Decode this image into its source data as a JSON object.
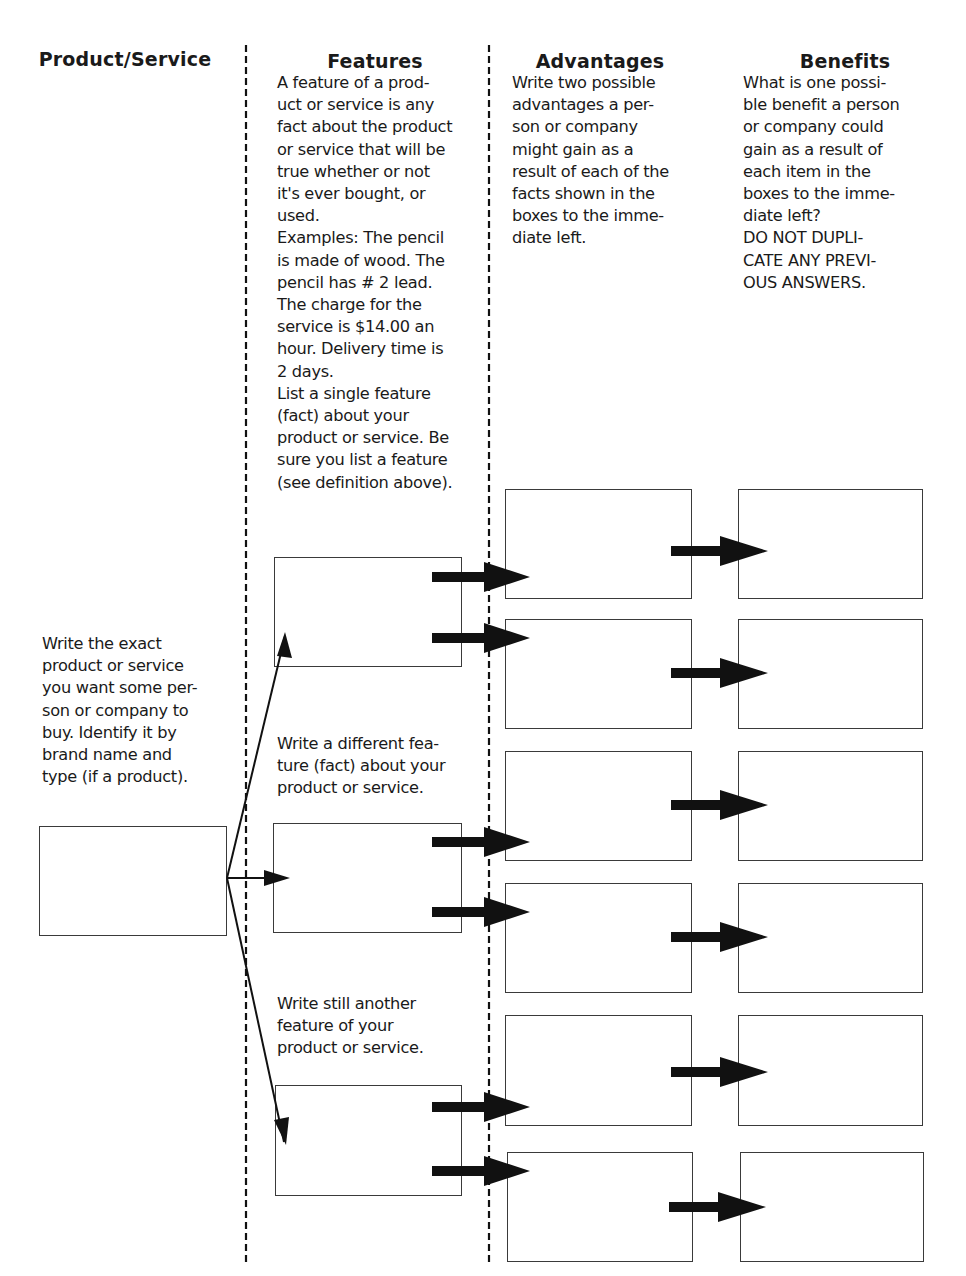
{
  "columns": {
    "product_service": {
      "header": "Product/Service",
      "instruction": "Write the exact\nproduct or service\nyou want some per-\nson or company to\nbuy. Identify it by\nbrand name and\ntype (if a product)."
    },
    "features": {
      "header": "Features",
      "instruction": "A feature of a prod-\nuct or service is any\nfact about the product\nor service that will be\ntrue whether or not\nit's ever bought, or\nused.\nExamples: The pencil\nis made of wood. The\npencil has # 2 lead.\nThe charge for the\nservice is $14.00 an\nhour. Delivery time is\n2 days.\nList a single feature\n(fact) about your\nproduct or service. Be\nsure you list a feature\n(see definition above).",
      "instruction_2": "Write a different fea-\nture (fact) about your\nproduct or service.",
      "instruction_3": "Write still another\nfeature of your\nproduct or service."
    },
    "advantages": {
      "header": "Advantages",
      "instruction": "Write two possible\nadvantages a per-\nson or company\nmight gain as a\nresult of each of the\nfacts shown in the\nboxes to the imme-\ndiate left."
    },
    "benefits": {
      "header": "Benefits",
      "instruction": "What is one possi-\nble benefit a person\nor company could\ngain as a result of\neach item in the\nboxes to the imme-\ndiate left?\nDO NOT DUPLI-\nCATE ANY PREVI-\nOUS ANSWERS."
    }
  },
  "boxes": {
    "product": "",
    "features": [
      "",
      "",
      ""
    ],
    "advantages": [
      "",
      "",
      "",
      "",
      "",
      ""
    ],
    "benefits": [
      "",
      "",
      "",
      "",
      "",
      ""
    ]
  },
  "colors": {
    "ink": "#1a1a1a",
    "box_border": "#3a3a3a",
    "background": "#ffffff"
  }
}
